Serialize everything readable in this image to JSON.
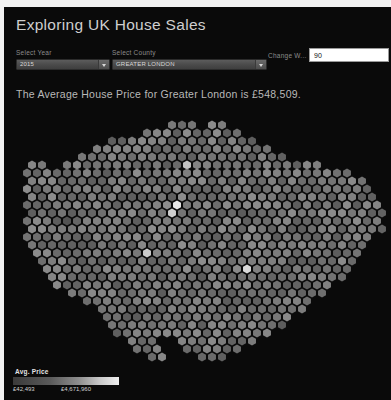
{
  "app": {
    "title": "Exploring UK House Sales",
    "background_color": "#0a0a0a",
    "frame_color": "#f2f2f2"
  },
  "controls": {
    "year": {
      "label": "Select Year",
      "value": "2015",
      "caret_icon": "chevron-down-icon",
      "options": [
        "2015"
      ]
    },
    "county": {
      "label": "Select County",
      "value": "GREATER LONDON",
      "caret_icon": "chevron-down-icon",
      "options": [
        "GREATER LONDON"
      ]
    },
    "width": {
      "label": "Change W...",
      "value": "90",
      "placeholder": "90"
    }
  },
  "summary": {
    "text": "The Average House Price for Greater London is £548,509.",
    "county": "Greater London",
    "average_price": "£548,509",
    "year": "2015"
  },
  "legend": {
    "title": "Avg. Price",
    "min": "£42,493",
    "max": "£4,671,960",
    "gradient_from": "#3a3a3a",
    "gradient_to": "#efefef"
  },
  "map": {
    "type": "hexbin-cartogram",
    "region": "Greater London",
    "hex_fill_low": "#4b4b4b",
    "hex_fill_high": "#f0f0f0",
    "background": "#000000",
    "hex_radius": 4.6,
    "rows": [
      {
        "y": 18,
        "xs": [
          168,
          178,
          188,
          208,
          218
        ]
      },
      {
        "y": 26,
        "xs": [
          143,
          153,
          163,
          173,
          183,
          193,
          203,
          213,
          223,
          233
        ]
      },
      {
        "y": 34,
        "xs": [
          108,
          118,
          128,
          138,
          148,
          158,
          168,
          178,
          188,
          198,
          208,
          218,
          228,
          238,
          248
        ]
      },
      {
        "y": 42,
        "xs": [
          93,
          103,
          113,
          123,
          133,
          143,
          153,
          163,
          173,
          183,
          193,
          203,
          213,
          223,
          233,
          243,
          253,
          263
        ]
      },
      {
        "y": 50,
        "xs": [
          78,
          88,
          98,
          108,
          118,
          128,
          138,
          148,
          158,
          168,
          178,
          188,
          198,
          208,
          218,
          228,
          238,
          248,
          258,
          268,
          278
        ]
      },
      {
        "y": 58,
        "xs": [
          28,
          38,
          63,
          73,
          83,
          93,
          103,
          113,
          123,
          133,
          143,
          153,
          163,
          173,
          183,
          193,
          203,
          213,
          223,
          233,
          243,
          253,
          263,
          273,
          283,
          293,
          303,
          313
        ]
      },
      {
        "y": 66,
        "xs": [
          23,
          33,
          43,
          53,
          63,
          73,
          83,
          93,
          103,
          113,
          123,
          133,
          143,
          153,
          163,
          173,
          183,
          193,
          203,
          213,
          223,
          233,
          243,
          253,
          263,
          273,
          283,
          293,
          303,
          313,
          323,
          333,
          343
        ]
      },
      {
        "y": 74,
        "xs": [
          28,
          38,
          48,
          58,
          68,
          78,
          88,
          98,
          108,
          118,
          128,
          138,
          148,
          158,
          168,
          178,
          188,
          198,
          208,
          218,
          228,
          238,
          248,
          258,
          268,
          278,
          288,
          298,
          308,
          318,
          328,
          338,
          348,
          358
        ]
      },
      {
        "y": 82,
        "xs": [
          23,
          33,
          43,
          53,
          63,
          73,
          83,
          93,
          103,
          113,
          123,
          133,
          143,
          153,
          163,
          173,
          183,
          193,
          203,
          213,
          223,
          233,
          243,
          253,
          263,
          273,
          283,
          293,
          303,
          313,
          323,
          333,
          343,
          353,
          363
        ]
      },
      {
        "y": 90,
        "xs": [
          28,
          38,
          48,
          58,
          68,
          78,
          88,
          98,
          108,
          118,
          128,
          138,
          148,
          158,
          168,
          178,
          188,
          198,
          208,
          218,
          228,
          238,
          248,
          258,
          268,
          278,
          288,
          298,
          308,
          318,
          328,
          338,
          348,
          358,
          368
        ]
      },
      {
        "y": 98,
        "xs": [
          23,
          33,
          43,
          53,
          63,
          73,
          83,
          93,
          103,
          113,
          123,
          133,
          143,
          153,
          163,
          173,
          183,
          193,
          203,
          213,
          223,
          233,
          243,
          253,
          263,
          273,
          283,
          293,
          303,
          313,
          323,
          333,
          343,
          353,
          363,
          373
        ]
      },
      {
        "y": 106,
        "xs": [
          28,
          38,
          48,
          58,
          68,
          78,
          88,
          98,
          108,
          118,
          128,
          138,
          148,
          158,
          168,
          178,
          188,
          198,
          208,
          218,
          228,
          238,
          248,
          258,
          268,
          278,
          288,
          298,
          308,
          318,
          328,
          338,
          348,
          358,
          368,
          378
        ]
      },
      {
        "y": 114,
        "xs": [
          23,
          33,
          43,
          53,
          63,
          73,
          83,
          93,
          103,
          113,
          123,
          133,
          143,
          153,
          163,
          173,
          183,
          193,
          203,
          213,
          223,
          233,
          243,
          253,
          263,
          273,
          283,
          293,
          303,
          313,
          323,
          333,
          343,
          353,
          363,
          373
        ]
      },
      {
        "y": 122,
        "xs": [
          28,
          38,
          48,
          58,
          68,
          78,
          88,
          98,
          108,
          118,
          128,
          138,
          148,
          158,
          168,
          178,
          188,
          198,
          208,
          218,
          228,
          238,
          248,
          258,
          268,
          278,
          288,
          298,
          308,
          318,
          328,
          338,
          348,
          358,
          368,
          378
        ]
      },
      {
        "y": 130,
        "xs": [
          23,
          33,
          43,
          53,
          63,
          73,
          83,
          93,
          103,
          113,
          123,
          133,
          143,
          153,
          163,
          173,
          183,
          193,
          203,
          213,
          223,
          233,
          243,
          253,
          263,
          273,
          283,
          293,
          303,
          313,
          323,
          333,
          343,
          353,
          363
        ]
      },
      {
        "y": 138,
        "xs": [
          28,
          38,
          48,
          58,
          68,
          78,
          88,
          98,
          108,
          118,
          128,
          138,
          148,
          158,
          168,
          178,
          188,
          198,
          208,
          218,
          228,
          238,
          248,
          258,
          268,
          278,
          288,
          298,
          308,
          318,
          328,
          338,
          348,
          358
        ]
      },
      {
        "y": 146,
        "xs": [
          33,
          43,
          53,
          63,
          73,
          83,
          93,
          103,
          113,
          123,
          133,
          143,
          153,
          163,
          173,
          183,
          193,
          203,
          213,
          223,
          233,
          243,
          253,
          263,
          273,
          283,
          293,
          303,
          313,
          323,
          333,
          343,
          353
        ]
      },
      {
        "y": 154,
        "xs": [
          38,
          48,
          58,
          68,
          78,
          88,
          98,
          108,
          118,
          128,
          138,
          148,
          158,
          168,
          178,
          188,
          198,
          208,
          218,
          228,
          238,
          248,
          258,
          268,
          278,
          288,
          298,
          308,
          318,
          328,
          338,
          348
        ]
      },
      {
        "y": 162,
        "xs": [
          43,
          53,
          63,
          73,
          83,
          93,
          103,
          113,
          123,
          133,
          143,
          153,
          163,
          173,
          183,
          193,
          203,
          213,
          223,
          233,
          243,
          253,
          263,
          273,
          283,
          293,
          303,
          313,
          323,
          333,
          343
        ]
      },
      {
        "y": 170,
        "xs": [
          48,
          58,
          68,
          78,
          88,
          98,
          108,
          118,
          128,
          138,
          148,
          158,
          168,
          178,
          188,
          198,
          208,
          218,
          228,
          238,
          248,
          258,
          268,
          278,
          288,
          298,
          308,
          318,
          328,
          338
        ]
      },
      {
        "y": 178,
        "xs": [
          53,
          63,
          73,
          83,
          93,
          103,
          113,
          123,
          133,
          143,
          153,
          163,
          173,
          183,
          193,
          203,
          213,
          223,
          233,
          243,
          253,
          263,
          273,
          283,
          293,
          303,
          313,
          323
        ]
      },
      {
        "y": 186,
        "xs": [
          68,
          78,
          88,
          98,
          108,
          118,
          128,
          138,
          148,
          158,
          168,
          178,
          188,
          198,
          208,
          218,
          228,
          238,
          248,
          258,
          268,
          278,
          288,
          298,
          308,
          318
        ]
      },
      {
        "y": 194,
        "xs": [
          83,
          93,
          103,
          113,
          123,
          133,
          143,
          153,
          163,
          173,
          183,
          193,
          203,
          213,
          223,
          233,
          243,
          253,
          263,
          273,
          283,
          293,
          303
        ]
      },
      {
        "y": 202,
        "xs": [
          98,
          108,
          118,
          128,
          138,
          148,
          158,
          168,
          178,
          188,
          198,
          208,
          218,
          228,
          238,
          248,
          258,
          268,
          278,
          288,
          298
        ]
      },
      {
        "y": 210,
        "xs": [
          103,
          113,
          123,
          133,
          143,
          153,
          163,
          173,
          183,
          193,
          203,
          213,
          223,
          233,
          243,
          253,
          263,
          273,
          283
        ]
      },
      {
        "y": 218,
        "xs": [
          108,
          118,
          128,
          138,
          148,
          158,
          168,
          178,
          188,
          198,
          208,
          218,
          228,
          238,
          248,
          258,
          268,
          278
        ]
      },
      {
        "y": 226,
        "xs": [
          113,
          123,
          133,
          143,
          153,
          163,
          173,
          183,
          193,
          203,
          213,
          223,
          233,
          243,
          253,
          263
        ]
      },
      {
        "y": 234,
        "xs": [
          128,
          138,
          148,
          178,
          188,
          198,
          208,
          218,
          228,
          238,
          248
        ]
      },
      {
        "y": 242,
        "xs": [
          133,
          143,
          153,
          183,
          193,
          203,
          213,
          223,
          233
        ]
      },
      {
        "y": 250,
        "xs": [
          148,
          158,
          198,
          208,
          218
        ]
      }
    ],
    "highlights": [
      {
        "x": 173,
        "y": 98,
        "v": 0.95
      },
      {
        "x": 168,
        "y": 106,
        "v": 0.8
      },
      {
        "x": 178,
        "y": 130,
        "v": 0.92
      },
      {
        "x": 143,
        "y": 146,
        "v": 0.78
      },
      {
        "x": 243,
        "y": 162,
        "v": 0.86
      },
      {
        "x": 268,
        "y": 226,
        "v": 0.98
      },
      {
        "x": 63,
        "y": 114,
        "v": 0.05
      },
      {
        "x": 183,
        "y": 58,
        "v": 0.72
      }
    ]
  }
}
